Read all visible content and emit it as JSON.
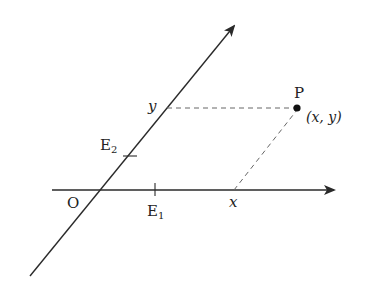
{
  "labels": {
    "origin": "O",
    "e1": "E",
    "e1_sub": "1",
    "e2": "E",
    "e2_sub": "2",
    "x_on_axis": "x",
    "y_on_axis": "y",
    "point_name": "P",
    "point_coords": "(x, y)"
  },
  "colors": {
    "axis": "#2a2a2a",
    "dashed": "#666666",
    "point": "#111111"
  }
}
